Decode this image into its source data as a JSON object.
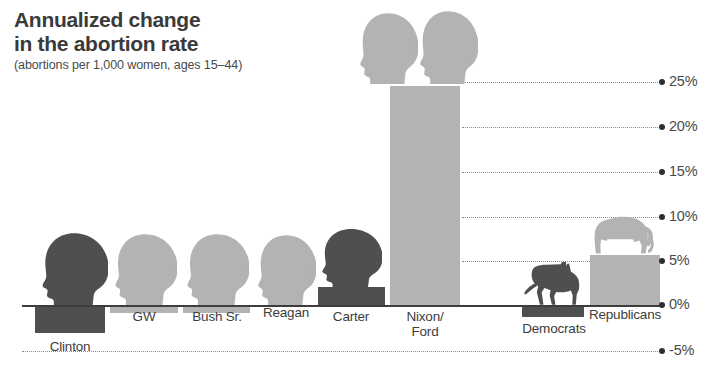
{
  "title": {
    "line1": "Annualized change",
    "line2": "in the abortion rate",
    "sub": "(abortions per 1,000 women,\nages 15–44)"
  },
  "axis": {
    "ticks": [
      {
        "label": "25%",
        "value": 25,
        "y": 82
      },
      {
        "label": "20%",
        "value": 20,
        "y": 127
      },
      {
        "label": "15%",
        "value": 15,
        "y": 172
      },
      {
        "label": "10%",
        "value": 10,
        "y": 217
      },
      {
        "label": "5%",
        "value": 5,
        "y": 261
      },
      {
        "label": "0%",
        "value": 0,
        "y": 305
      },
      {
        "label": "-5%",
        "value": -5,
        "y": 351
      }
    ],
    "zero_y": 305,
    "unit": "%",
    "position": "right"
  },
  "colors": {
    "dark_gray": "#4f4f4f",
    "light_gray": "#b3b3b3",
    "text": "#3d3d3d",
    "grid": "#8c8c8c",
    "background": "#ffffff"
  },
  "chart_data": {
    "type": "bar",
    "title": "Annualized change in the abortion rate",
    "subtitle": "(abortions per 1,000 women, ages 15–44)",
    "xlabel": "",
    "ylabel": "Annualized change (%)",
    "ylim": [
      -5,
      25
    ],
    "grid": true,
    "legend": "none",
    "categories": [
      "Clinton",
      "GW",
      "Bush Sr.",
      "Reagan",
      "Carter",
      "Nixon/\nFord",
      "Democrats",
      "Republicans"
    ],
    "values": [
      -3.1,
      -0.9,
      -0.9,
      0.0,
      2.0,
      24.5,
      -1.3,
      5.6
    ],
    "series": [
      {
        "name": "Annualized change in the abortion rate",
        "values": [
          -3.1,
          -0.9,
          -0.9,
          0.0,
          2.0,
          24.5,
          -1.3,
          5.6
        ]
      }
    ],
    "annotations": [
      "Presidential head silhouettes sit atop each administration column",
      "Donkey icon marks the Democrats column, elephant icon marks the Republicans column"
    ]
  },
  "bars": [
    {
      "name": "clinton",
      "label": "Clinton",
      "value": -3.1,
      "shade": "dark",
      "x": 35,
      "w": 70,
      "label_x": 35,
      "label_w": 70,
      "label_y": 340
    },
    {
      "name": "gw",
      "label": "GW",
      "value": -0.9,
      "shade": "light",
      "x": 110,
      "w": 68,
      "label_x": 110,
      "label_w": 68,
      "label_y": 310
    },
    {
      "name": "bush-sr",
      "label": "Bush Sr.",
      "value": -0.9,
      "shade": "light",
      "x": 183,
      "w": 67,
      "label_x": 181,
      "label_w": 72,
      "label_y": 310
    },
    {
      "name": "reagan",
      "label": "Reagan",
      "value": 0.0,
      "shade": "light",
      "x": 255,
      "w": 60,
      "label_x": 252,
      "label_w": 68,
      "label_y": 306
    },
    {
      "name": "carter",
      "label": "Carter",
      "value": 2.0,
      "shade": "dark",
      "x": 318,
      "w": 67,
      "label_x": 316,
      "label_w": 70,
      "label_y": 310
    },
    {
      "name": "nixon-ford",
      "label": "Nixon/\nFord",
      "value": 24.5,
      "shade": "light",
      "x": 390,
      "w": 70,
      "label_x": 388,
      "label_w": 74,
      "label_y": 310
    },
    {
      "name": "democrats",
      "label": "Democrats",
      "value": -1.3,
      "shade": "dark",
      "x": 522,
      "w": 62,
      "label_x": 514,
      "label_w": 80,
      "label_y": 322
    },
    {
      "name": "republicans",
      "label": "Republicans",
      "value": 5.6,
      "shade": "light",
      "x": 590,
      "w": 70,
      "label_x": 580,
      "label_w": 90,
      "label_y": 308
    }
  ],
  "icons": [
    {
      "name": "head-clinton",
      "kind": "head",
      "shade": "dark",
      "x": 40,
      "y": 232,
      "w": 68,
      "h": 74
    },
    {
      "name": "head-gw",
      "kind": "head",
      "shade": "light",
      "x": 113,
      "y": 233,
      "w": 64,
      "h": 72
    },
    {
      "name": "head-bush-sr",
      "kind": "head",
      "shade": "light",
      "x": 185,
      "y": 233,
      "w": 64,
      "h": 72
    },
    {
      "name": "head-reagan",
      "kind": "head",
      "shade": "light",
      "x": 256,
      "y": 234,
      "w": 60,
      "h": 71
    },
    {
      "name": "head-carter",
      "kind": "head",
      "shade": "dark",
      "x": 320,
      "y": 228,
      "w": 62,
      "h": 60
    },
    {
      "name": "head-nixon",
      "kind": "head",
      "shade": "light",
      "x": 358,
      "y": 12,
      "w": 60,
      "h": 72
    },
    {
      "name": "head-ford",
      "kind": "head",
      "shade": "light",
      "x": 418,
      "y": 10,
      "w": 60,
      "h": 74
    },
    {
      "name": "donkey-democrats",
      "kind": "donkey",
      "shade": "dark",
      "x": 520,
      "y": 262,
      "w": 62,
      "h": 44
    },
    {
      "name": "elephant-republicans",
      "kind": "elephant",
      "shade": "light",
      "x": 592,
      "y": 214,
      "w": 66,
      "h": 42
    }
  ],
  "gridlines": [
    {
      "value": 25,
      "y": 82,
      "x": 462,
      "w": 196
    },
    {
      "value": 20,
      "y": 127,
      "x": 462,
      "w": 196
    },
    {
      "value": 15,
      "y": 172,
      "x": 462,
      "w": 196
    },
    {
      "value": 10,
      "y": 217,
      "x": 462,
      "w": 196
    },
    {
      "value": 5,
      "y": 261,
      "x": 462,
      "w": 196
    },
    {
      "value": -5,
      "y": 351,
      "x": 22,
      "w": 636
    }
  ]
}
